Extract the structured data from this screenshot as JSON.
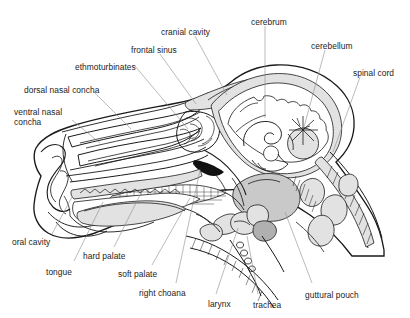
{
  "figure": {
    "kind": "anatomical-diagram",
    "background_color": "#ffffff",
    "line_color": "#1a1a1a",
    "leader_color": "#8d8d8d",
    "label_text_color": "#1c1c1c"
  },
  "labels": [
    {
      "id": "cranial-cavity",
      "text": "cranial cavity",
      "x": 161,
      "y": 27,
      "wrap": false
    },
    {
      "id": "cerebrum",
      "text": "cerebrum",
      "x": 251,
      "y": 17,
      "wrap": false
    },
    {
      "id": "cerebellum",
      "text": "cerebellum",
      "x": 311,
      "y": 41,
      "wrap": false
    },
    {
      "id": "spinal-cord",
      "text": "spinal cord",
      "x": 353,
      "y": 68,
      "wrap": false
    },
    {
      "id": "frontal-sinus",
      "text": "frontal sinus",
      "x": 131,
      "y": 45,
      "wrap": false
    },
    {
      "id": "ethmoturbinates",
      "text": "ethmoturbinates",
      "x": 75,
      "y": 62,
      "wrap": false
    },
    {
      "id": "dorsal-nasal-concha",
      "text": "dorsal nasal concha",
      "x": 24,
      "y": 85,
      "wrap": false
    },
    {
      "id": "ventral-nasal-concha",
      "text": "ventral nasal concha",
      "x": 14,
      "y": 107,
      "wrap": true
    },
    {
      "id": "oral-cavity",
      "text": "oral cavity",
      "x": 12,
      "y": 237,
      "wrap": false
    },
    {
      "id": "tongue",
      "text": "tongue",
      "x": 46,
      "y": 267,
      "wrap": false
    },
    {
      "id": "hard-palate",
      "text": "hard palate",
      "x": 83,
      "y": 251,
      "wrap": false
    },
    {
      "id": "soft-palate",
      "text": "soft palate",
      "x": 118,
      "y": 269,
      "wrap": false
    },
    {
      "id": "right-choana",
      "text": "right choana",
      "x": 139,
      "y": 288,
      "wrap": false
    },
    {
      "id": "larynx",
      "text": "larynx",
      "x": 208,
      "y": 299,
      "wrap": false
    },
    {
      "id": "trachea",
      "text": "trachea",
      "x": 253,
      "y": 300,
      "wrap": false
    },
    {
      "id": "guttural-pouch",
      "text": "guttural pouch",
      "x": 305,
      "y": 290,
      "wrap": false
    }
  ],
  "leaders": [
    {
      "id": "leader-cranial-cavity",
      "d": "M 195 36 L 227 95"
    },
    {
      "id": "leader-cerebrum",
      "d": "M 265 26 L 265 118"
    },
    {
      "id": "leader-cerebellum",
      "d": "M 325 50 L 304 127"
    },
    {
      "id": "leader-spinal-cord",
      "d": "M 360 77 L 333 152"
    },
    {
      "id": "leader-frontal-sinus",
      "d": "M 160 54 L 196 104"
    },
    {
      "id": "leader-ethmoturbinates",
      "d": "M 135 66 L 188 129"
    },
    {
      "id": "leader-dorsal-nasal-concha",
      "d": "M 93 91  L 131 129"
    },
    {
      "id": "leader-ventral-nasal-concha",
      "d": "M 72 120 L 100 143"
    },
    {
      "id": "leader-oral-cavity",
      "d": "M 52 234 L 72 197"
    },
    {
      "id": "leader-tongue",
      "d": "M 74 261 L 103 202"
    },
    {
      "id": "leader-hard-palate",
      "d": "M 114 247 L 140 195"
    },
    {
      "id": "leader-soft-palate",
      "d": "M 152 265 L 190 198"
    },
    {
      "id": "leader-right-choana",
      "d": "M 176 283 L 200 170"
    },
    {
      "id": "leader-larynx",
      "d": "M 216 294 L 238 228"
    },
    {
      "id": "leader-trachea",
      "d": "M 258 294 L 247 236"
    },
    {
      "id": "leader-guttural-pouch",
      "d": "M 312 283 L 285 212"
    }
  ]
}
